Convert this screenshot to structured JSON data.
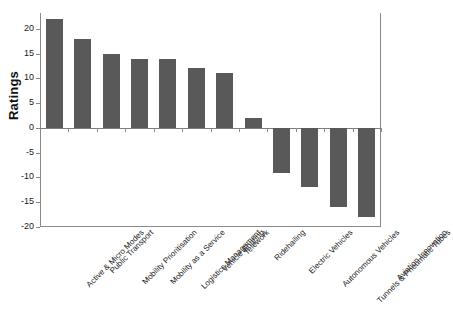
{
  "chart_data": {
    "type": "bar",
    "title": "",
    "xlabel": "",
    "ylabel": "Ratings",
    "ylim": [
      -20,
      23.2
    ],
    "grid": false,
    "legend": null,
    "orientation": "vertical",
    "bar_color": "#595959",
    "categories": [
      "Active & Micro Modes",
      "Public Transport",
      "Mobility Prioritisation",
      "Mobility as a Service",
      "Logistics Management",
      "Vehicle Sharing",
      "Telework",
      "Ridehailing",
      "Electric Vehicles",
      "Autonomous Vehicles",
      "Tunnels & Pneumatic Tubes",
      "Aviation Innovation"
    ],
    "values": [
      22,
      18,
      15,
      14,
      14,
      12,
      11,
      2,
      -9,
      -12,
      -16,
      -18
    ],
    "yticks": [
      20,
      15,
      10,
      5,
      0,
      -5,
      -10,
      -15,
      -20
    ],
    "ytick_labels": [
      "20",
      "15",
      "10",
      "5",
      "0",
      "-5",
      "-10",
      "-15",
      "-20"
    ]
  }
}
